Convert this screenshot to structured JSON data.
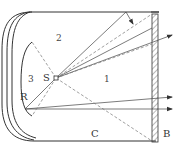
{
  "diagram": {
    "type": "optical-ray-diagram",
    "labels": {
      "source": "S",
      "reflector": "R",
      "screen": "B",
      "region_c": "C",
      "zone_1": "1",
      "zone_2": "2",
      "zone_3": "3"
    },
    "colors": {
      "line": "#333333",
      "dashed": "#777777",
      "background": "#ffffff"
    }
  }
}
